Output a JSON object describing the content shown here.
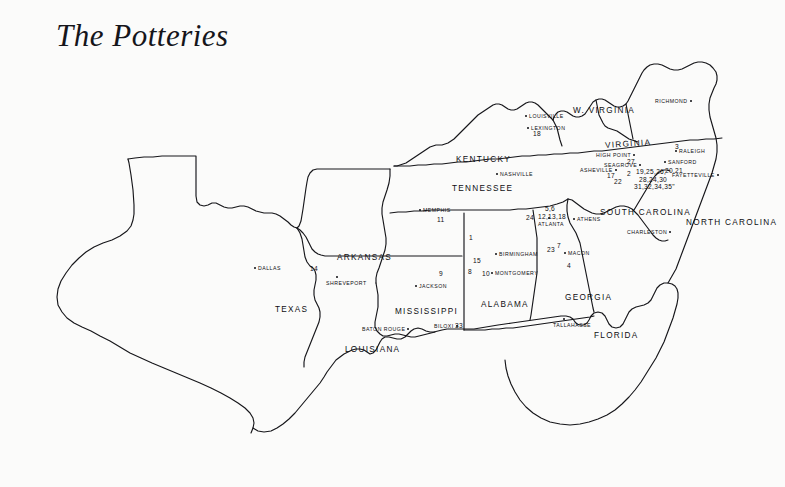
{
  "page": {
    "title": "The Potteries",
    "background_color": "#fbfbfa",
    "ink_color": "#0d0d11"
  },
  "map": {
    "kind": "hand-drawn-outline-map",
    "region": "Southeastern United States",
    "states": [
      {
        "name": "TEXAS",
        "x": 275,
        "y": 305,
        "rotate": 0
      },
      {
        "name": "ARKANSAS",
        "x": 337,
        "y": 253,
        "rotate": 0
      },
      {
        "name": "LOUISIANA",
        "x": 345,
        "y": 345,
        "rotate": 0
      },
      {
        "name": "MISSISSIPPI",
        "x": 395,
        "y": 307,
        "rotate": 0
      },
      {
        "name": "ALABAMA",
        "x": 481,
        "y": 300,
        "rotate": 0
      },
      {
        "name": "GEORGIA",
        "x": 565,
        "y": 293,
        "rotate": 0
      },
      {
        "name": "FLORIDA",
        "x": 594,
        "y": 331,
        "rotate": 0
      },
      {
        "name": "TENNESSEE",
        "x": 452,
        "y": 184,
        "rotate": 0
      },
      {
        "name": "KENTUCKY",
        "x": 456,
        "y": 155,
        "rotate": 0
      },
      {
        "name": "W. VIRGINIA",
        "x": 573,
        "y": 106,
        "rotate": 0
      },
      {
        "name": "VIRGINIA",
        "x": 605,
        "y": 141,
        "rotate": -4
      },
      {
        "name": "NORTH CAROLINA",
        "x": 686,
        "y": 218,
        "rotate": 0
      },
      {
        "name": "SOUTH CAROLINA",
        "x": 600,
        "y": 208,
        "rotate": 0
      }
    ],
    "cities": [
      {
        "name": "DALLAS",
        "x": 258,
        "y": 265,
        "dot": "left"
      },
      {
        "name": "SHREVEPORT",
        "x": 326,
        "y": 280,
        "dot": "above"
      },
      {
        "name": "BATON ROUGE",
        "x": 362,
        "y": 326,
        "dot": "right"
      },
      {
        "name": "BILOXI",
        "x": 434,
        "y": 323,
        "dot": "right"
      },
      {
        "name": "JACKSON",
        "x": 419,
        "y": 283,
        "dot": "left"
      },
      {
        "name": "MONTGOMERY",
        "x": 495,
        "y": 270,
        "dot": "left"
      },
      {
        "name": "BIRMINGHAM",
        "x": 499,
        "y": 251,
        "dot": "left"
      },
      {
        "name": "MEMPHIS",
        "x": 423,
        "y": 207,
        "dot": "left"
      },
      {
        "name": "NASHVILLE",
        "x": 500,
        "y": 171,
        "dot": "left"
      },
      {
        "name": "LOUISVILLE",
        "x": 529,
        "y": 113,
        "dot": "left"
      },
      {
        "name": "LEXINGTON",
        "x": 531,
        "y": 125,
        "dot": "left"
      },
      {
        "name": "RICHMOND",
        "x": 655,
        "y": 98,
        "dot": "right"
      },
      {
        "name": "HIGH POINT",
        "x": 596,
        "y": 152,
        "dot": "right"
      },
      {
        "name": "SEAGROVE",
        "x": 604,
        "y": 162,
        "dot": "right"
      },
      {
        "name": "ASHEVILLE",
        "x": 580,
        "y": 167,
        "dot": "right"
      },
      {
        "name": "RALEIGH",
        "x": 679,
        "y": 148,
        "dot": "left"
      },
      {
        "name": "SANFORD",
        "x": 668,
        "y": 159,
        "dot": "left"
      },
      {
        "name": "FAYETTEVILLE",
        "x": 672,
        "y": 172,
        "dot": "right"
      },
      {
        "name": "CHARLESTON",
        "x": 627,
        "y": 229,
        "dot": "right"
      },
      {
        "name": "ATLANTA",
        "x": 538,
        "y": 221,
        "dot": "above"
      },
      {
        "name": "ATHENS",
        "x": 577,
        "y": 216,
        "dot": "left"
      },
      {
        "name": "MACON",
        "x": 568,
        "y": 250,
        "dot": "left"
      },
      {
        "name": "TALLAHASSE",
        "x": 553,
        "y": 322,
        "dot": "above"
      }
    ],
    "pottery_numbers": [
      {
        "label": "14",
        "x": 310,
        "y": 265
      },
      {
        "label": "9",
        "x": 439,
        "y": 270
      },
      {
        "label": "33",
        "x": 455,
        "y": 322
      },
      {
        "label": "1",
        "x": 469,
        "y": 234
      },
      {
        "label": "15",
        "x": 473,
        "y": 257
      },
      {
        "label": "8",
        "x": 468,
        "y": 268
      },
      {
        "label": "10",
        "x": 482,
        "y": 270
      },
      {
        "label": "11",
        "x": 437,
        "y": 216
      },
      {
        "label": "18",
        "x": 533,
        "y": 130
      },
      {
        "label": "5,6",
        "x": 545,
        "y": 205
      },
      {
        "label": "12,13,18",
        "x": 538,
        "y": 213
      },
      {
        "label": "24",
        "x": 526,
        "y": 214
      },
      {
        "label": "23",
        "x": 547,
        "y": 246
      },
      {
        "label": "7",
        "x": 557,
        "y": 242
      },
      {
        "label": "4",
        "x": 567,
        "y": 262
      },
      {
        "label": "27",
        "x": 627,
        "y": 158
      },
      {
        "label": "3",
        "x": 675,
        "y": 143
      },
      {
        "label": "20,21",
        "x": 665,
        "y": 167
      },
      {
        "label": "17",
        "x": 607,
        "y": 172
      },
      {
        "label": "22",
        "x": 614,
        "y": 178
      },
      {
        "label": "2",
        "x": 627,
        "y": 170
      },
      {
        "label": "19,25,26,",
        "x": 636,
        "y": 168
      },
      {
        "label": "28,24,30",
        "x": 639,
        "y": 176
      },
      {
        "label": "31,32,34,35\"",
        "x": 634,
        "y": 183
      }
    ]
  }
}
